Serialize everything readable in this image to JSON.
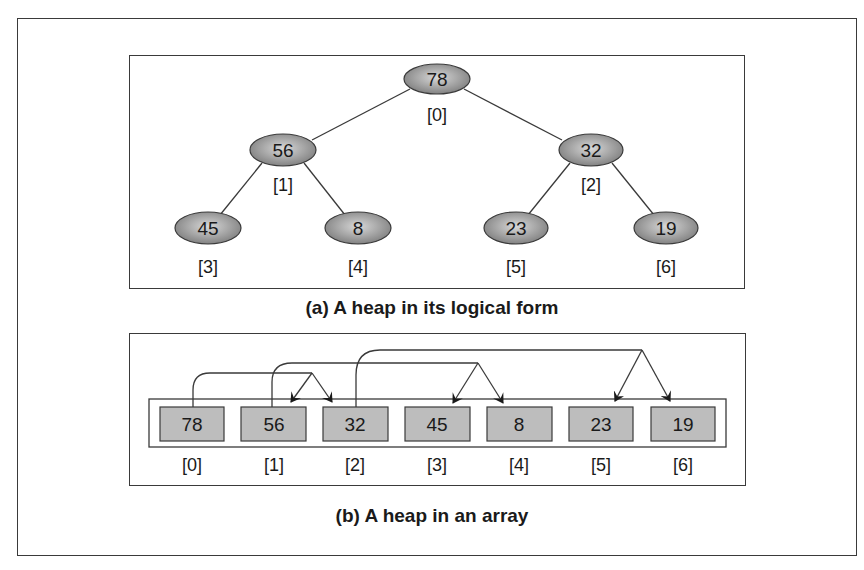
{
  "tree": {
    "caption": "(a) A heap in its logical form",
    "nodes": [
      {
        "value": "78",
        "index": "[0]"
      },
      {
        "value": "56",
        "index": "[1]"
      },
      {
        "value": "32",
        "index": "[2]"
      },
      {
        "value": "45",
        "index": "[3]"
      },
      {
        "value": "8",
        "index": "[4]"
      },
      {
        "value": "23",
        "index": "[5]"
      },
      {
        "value": "19",
        "index": "[6]"
      }
    ],
    "edges": [
      [
        0,
        1
      ],
      [
        0,
        2
      ],
      [
        1,
        3
      ],
      [
        1,
        4
      ],
      [
        2,
        5
      ],
      [
        2,
        6
      ]
    ]
  },
  "array": {
    "caption": "(b) A heap in an array",
    "cells": [
      {
        "value": "78",
        "index": "[0]"
      },
      {
        "value": "56",
        "index": "[1]"
      },
      {
        "value": "32",
        "index": "[2]"
      },
      {
        "value": "45",
        "index": "[3]"
      },
      {
        "value": "8",
        "index": "[4]"
      },
      {
        "value": "23",
        "index": "[5]"
      },
      {
        "value": "19",
        "index": "[6]"
      }
    ],
    "child_arrows": [
      {
        "from": 0,
        "to": [
          1,
          2
        ]
      },
      {
        "from": 1,
        "to": [
          3,
          4
        ]
      },
      {
        "from": 2,
        "to": [
          5,
          6
        ]
      }
    ]
  },
  "colors": {
    "node_fill_light": "#d4d4d4",
    "node_fill_dark": "#7a7a7a",
    "cell_fill": "#bdbdbd",
    "line": "#3a3a3a"
  }
}
